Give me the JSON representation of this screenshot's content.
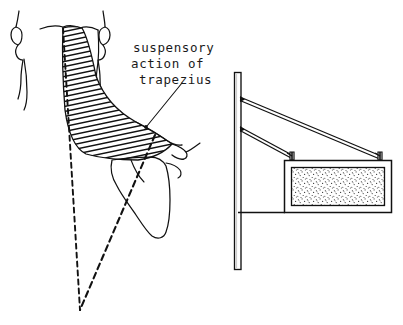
{
  "figure": {
    "title": "suspensory action of trapezius",
    "ink_color": "#111111",
    "background_color": "#ffffff",
    "stipple_color": "#3a3a3a",
    "panels": [
      {
        "name": "anatomical-panel",
        "description": "posterior view of neck, shoulder and scapula with hatched trapezius muscle"
      },
      {
        "name": "mechanical-analogy-panel",
        "description": "vertical post with two guy cables suspending a hanging signboard"
      }
    ]
  },
  "annotation": {
    "line1": "suspensory",
    "line2": "action of",
    "line3": "trapezius",
    "leader_from": {
      "x": 182,
      "y": 83
    },
    "leader_to": {
      "x": 146,
      "y": 127
    }
  },
  "anatomy": {
    "labels": {
      "left_ear": "left ear",
      "right_ear": "right ear",
      "neck": "neck contour",
      "trapezius": "trapezius muscle (hatched)",
      "scapula": "scapula",
      "acromion": "acromion process",
      "midline": "vertical midline (dashed)",
      "scapula_axis": "scapular axis (dashed)"
    },
    "hatch_line_count": 34
  },
  "mechanics": {
    "labels": {
      "post": "vertical post",
      "upper_cable": "upper suspension cable",
      "lower_cable": "lower suspension cable",
      "bracket_left": "left hook bracket",
      "bracket_right": "right hook bracket",
      "sign_frame": "sign frame",
      "sign_panel": "stippled sign panel",
      "ground_bar": "horizontal bottom bar"
    },
    "post": {
      "x1": 234,
      "y1": 72,
      "x2": 241,
      "y2": 270
    },
    "cable_attach_points": [
      {
        "x": 239,
        "y": 98
      },
      {
        "x": 239,
        "y": 128
      }
    ],
    "sign": {
      "x": 284,
      "y": 160,
      "width": 108,
      "height": 53
    }
  }
}
